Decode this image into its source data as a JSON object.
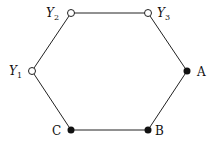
{
  "diagram": {
    "type": "hexagon-graph",
    "nodes": [
      {
        "id": "Y1",
        "label": "Y",
        "sub": "1",
        "x": 32,
        "y": 71,
        "filled": false
      },
      {
        "id": "Y2",
        "label": "Y",
        "sub": "2",
        "x": 71,
        "y": 13,
        "filled": false
      },
      {
        "id": "Y3",
        "label": "Y",
        "sub": "3",
        "x": 148,
        "y": 13,
        "filled": false
      },
      {
        "id": "A",
        "label": "A",
        "x": 187,
        "y": 71,
        "filled": true
      },
      {
        "id": "B",
        "label": "B",
        "x": 148,
        "y": 130,
        "filled": true
      },
      {
        "id": "C",
        "label": "C",
        "x": 71,
        "y": 130,
        "filled": true
      }
    ],
    "edges": [
      [
        "Y2",
        "Y3"
      ],
      [
        "Y3",
        "A"
      ],
      [
        "A",
        "B"
      ],
      [
        "B",
        "C"
      ],
      [
        "C",
        "Y1"
      ],
      [
        "Y1",
        "Y2"
      ]
    ]
  }
}
